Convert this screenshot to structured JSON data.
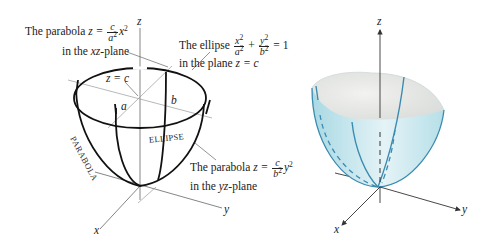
{
  "left_figure": {
    "axis_labels": {
      "z": "z",
      "y": "y",
      "x": "x"
    },
    "annotations": {
      "parabola_xz": {
        "prefix": "The parabola ",
        "z_eq": "z = ",
        "frac_num": "c",
        "frac_den": "a",
        "frac_den_exp": "2",
        "var": "x",
        "var_exp": "2",
        "line2_prefix": "in the ",
        "plane": "xz",
        "line2_suffix": "-plane"
      },
      "ellipse": {
        "prefix": "The ellipse ",
        "t1_num": "x",
        "t1_num_exp": "2",
        "t1_den": "a",
        "t1_den_exp": "2",
        "plus": " + ",
        "t2_num": "y",
        "t2_num_exp": "2",
        "t2_den": "b",
        "t2_den_exp": "2",
        "rhs": " = 1",
        "line2_prefix": "in the plane ",
        "line2_eq": "z = c"
      },
      "parabola_yz": {
        "prefix": "The parabola ",
        "z_eq": "z = ",
        "frac_num": "c",
        "frac_den": "b",
        "frac_den_exp": "2",
        "var": "y",
        "var_exp": "2",
        "line2_prefix": "in the ",
        "plane": "yz",
        "line2_suffix": "-plane"
      },
      "z_eq_c": "z = c",
      "a": "a",
      "b": "b",
      "curve_label_parabola": "PARABOLA",
      "curve_label_ellipse": "ELLIPSE"
    },
    "colors": {
      "stroke": "#1a1a1a",
      "guide": "#888888"
    }
  },
  "right_figure": {
    "axis_labels": {
      "z": "z",
      "y": "y",
      "x": "x"
    },
    "colors": {
      "surface_outer": "#bfe4ec",
      "surface_inner": "#ececea",
      "curve": "#3a8bb0",
      "axis": "#333333"
    }
  }
}
